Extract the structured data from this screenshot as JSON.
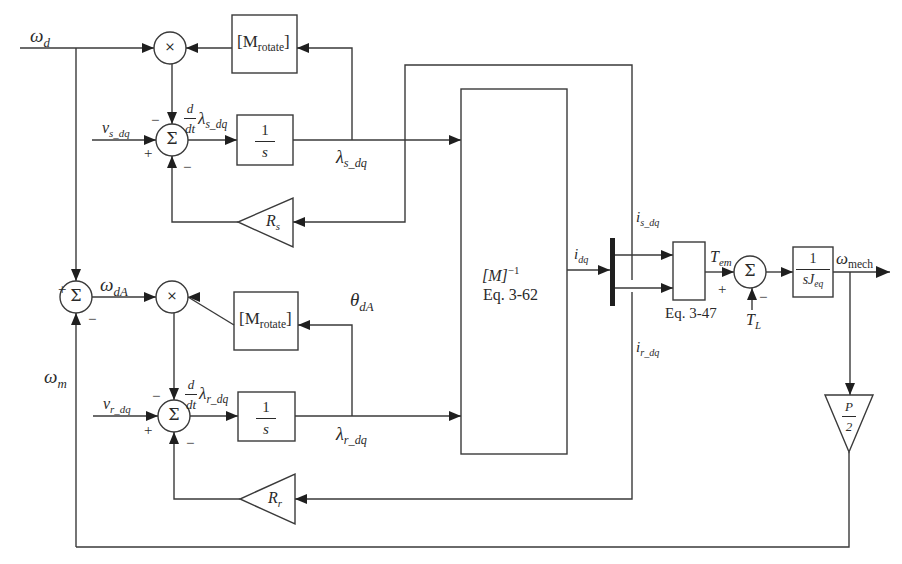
{
  "diagram": {
    "title": "",
    "type": "block-diagram",
    "signals": {
      "omega_d": {
        "base": "ω",
        "sub": "d"
      },
      "v_s_dq": {
        "base": "v",
        "sub": "s_dq"
      },
      "v_r_dq": {
        "base": "v",
        "sub": "r_dq"
      },
      "lambda_s_dq": {
        "base": "λ",
        "sub": "s_dq"
      },
      "lambda_r_dq": {
        "base": "λ",
        "sub": "r_dq"
      },
      "omega_dA": {
        "base": "ω",
        "sub": "dA"
      },
      "omega_m": {
        "base": "ω",
        "sub": "m"
      },
      "theta_dA": {
        "base": "θ",
        "sub": "dA"
      },
      "i_dq": {
        "base": "i",
        "sub": "dq"
      },
      "i_s_dq": {
        "base": "i",
        "sub": "s_dq"
      },
      "i_r_dq": {
        "base": "i",
        "sub": "r_dq"
      },
      "T_em": {
        "base": "T",
        "sub": "em"
      },
      "T_L": {
        "base": "T",
        "sub": "L"
      },
      "omega_mech": {
        "base": "ω",
        "sub": "mech"
      },
      "ddt_lambda_s": {
        "num": "d",
        "den": "dt",
        "base": "λ",
        "sub": "s_dq"
      },
      "ddt_lambda_r": {
        "num": "d",
        "den": "dt",
        "base": "λ",
        "sub": "r_dq"
      }
    },
    "blocks": {
      "m_rotate_top": {
        "open": "[M",
        "sub": "rotate",
        "close": "]"
      },
      "m_rotate_bottom": {
        "open": "[M",
        "sub": "rotate",
        "close": "]"
      },
      "integrator_s": {
        "num": "1",
        "den": "s"
      },
      "integrator_r": {
        "num": "1",
        "den": "s"
      },
      "gain_rs": {
        "base": "R",
        "sub": "s"
      },
      "gain_rr": {
        "base": "R",
        "sub": "r"
      },
      "inverse_m": {
        "line1_base": "[M]",
        "line1_sup": "−1",
        "line2": "Eq. 3-62"
      },
      "torque_eq": {
        "caption": "Eq. 3-47"
      },
      "mech_integrator": {
        "num": "1",
        "den_base": "sJ",
        "den_sub": "eq"
      },
      "pole_gain": {
        "num": "P",
        "den": "2"
      }
    },
    "operators": {
      "multiply": "×",
      "sum": "Σ",
      "plus": "+",
      "minus": "−"
    }
  }
}
